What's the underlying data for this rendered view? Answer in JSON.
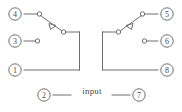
{
  "diagram": {
    "colors": {
      "line": "#6e6e6e",
      "text": "#4a4a4a",
      "background": "#ffffff"
    },
    "input_label": "input",
    "pins": [
      {
        "id": "pin-4",
        "label": "4",
        "side": "left",
        "row": "top",
        "cx": 15,
        "cy": 14,
        "role": "normally-open-contact"
      },
      {
        "id": "pin-3",
        "label": "3",
        "side": "left",
        "row": "middle",
        "cx": 15,
        "cy": 41,
        "role": "normally-closed-contact"
      },
      {
        "id": "pin-1",
        "label": "1",
        "side": "left",
        "row": "bottom",
        "cx": 15,
        "cy": 70,
        "role": "common-pole"
      },
      {
        "id": "pin-5",
        "label": "5",
        "side": "right",
        "row": "top",
        "cx": 167,
        "cy": 14,
        "role": "normally-open-contact"
      },
      {
        "id": "pin-6",
        "label": "6",
        "side": "right",
        "row": "middle",
        "cx": 167,
        "cy": 41,
        "role": "normally-closed-contact"
      },
      {
        "id": "pin-8",
        "label": "8",
        "side": "right",
        "row": "bottom",
        "cx": 167,
        "cy": 70,
        "role": "common-pole"
      },
      {
        "id": "pin-2",
        "label": "2",
        "side": "left",
        "row": "coil",
        "cx": 44,
        "cy": 95,
        "role": "coil-terminal"
      },
      {
        "id": "pin-7",
        "label": "7",
        "side": "right",
        "row": "coil",
        "cx": 139,
        "cy": 95,
        "role": "coil-terminal"
      }
    ],
    "contacts": [
      {
        "id": "contact-left",
        "type": "changeover-switch",
        "state": "open"
      },
      {
        "id": "contact-right",
        "type": "changeover-switch",
        "state": "open"
      }
    ]
  }
}
